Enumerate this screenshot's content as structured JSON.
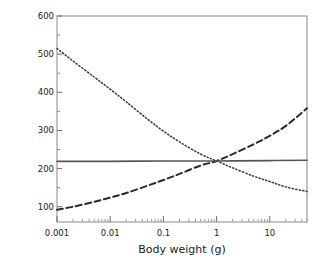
{
  "chart_data": {
    "type": "line",
    "title": "",
    "xlabel": "Body weight (g)",
    "ylabel": "Resource density for maintenance (mg/L)",
    "xscale": "log",
    "yscale": "linear",
    "xlim": [
      0.001,
      50
    ],
    "ylim": [
      60,
      600
    ],
    "grid": false,
    "legend": "none",
    "xticks": [
      0.001,
      0.01,
      0.1,
      1,
      10
    ],
    "xticklabels": [
      "0.001",
      "0.01",
      "0.1",
      "1",
      "10"
    ],
    "yticks": [
      100,
      200,
      300,
      400,
      500,
      600
    ],
    "yticklabels": [
      "100",
      "200",
      "300",
      "400",
      "500",
      "600"
    ],
    "yminorticks": [
      150,
      250,
      350,
      450,
      550
    ],
    "series": [
      {
        "name": "dotted-declining",
        "style": "dotted",
        "color": "#3a3a3a",
        "x": [
          0.001,
          0.002,
          0.005,
          0.01,
          0.02,
          0.05,
          0.1,
          0.2,
          0.5,
          1,
          2,
          5,
          10,
          20,
          50
        ],
        "values": [
          515,
          482,
          440,
          408,
          375,
          330,
          298,
          270,
          238,
          220,
          202,
          180,
          166,
          152,
          140
        ]
      },
      {
        "name": "dashed-rising",
        "style": "dashed",
        "color": "#2b2b2b",
        "x": [
          0.001,
          0.002,
          0.005,
          0.01,
          0.02,
          0.05,
          0.1,
          0.2,
          0.5,
          1,
          2,
          5,
          10,
          20,
          50
        ],
        "values": [
          92,
          100,
          113,
          124,
          136,
          155,
          170,
          186,
          208,
          220,
          238,
          264,
          286,
          312,
          358
        ]
      },
      {
        "name": "solid-flat",
        "style": "solid",
        "color": "#555555",
        "x": [
          0.001,
          0.01,
          0.1,
          1,
          10,
          50
        ],
        "values": [
          219,
          219,
          220,
          220,
          221,
          222
        ]
      }
    ]
  }
}
